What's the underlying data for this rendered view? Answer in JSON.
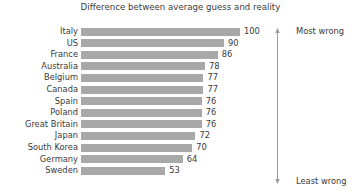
{
  "chart_data": {
    "type": "bar",
    "orientation": "horizontal",
    "title": "Difference between average guess and reality",
    "xlabel": "",
    "ylabel": "",
    "xlim": [
      0,
      100
    ],
    "grid": false,
    "legend": null,
    "categories": [
      "Italy",
      "US",
      "France",
      "Australia",
      "Belgium",
      "Canada",
      "Spain",
      "Poland",
      "Great Britain",
      "Japan",
      "South Korea",
      "Germany",
      "Sweden"
    ],
    "values": [
      100,
      90,
      86,
      78,
      77,
      77,
      76,
      76,
      76,
      72,
      70,
      64,
      53
    ],
    "bar_color": "#a8a8a8",
    "annotations": [
      {
        "text": "Most wrong",
        "position": "top-right"
      },
      {
        "text": "Least wrong",
        "position": "bottom-right"
      }
    ]
  },
  "rows": [
    {
      "label": "Italy",
      "value": 100
    },
    {
      "label": "US",
      "value": 90
    },
    {
      "label": "France",
      "value": 86
    },
    {
      "label": "Australia",
      "value": 78
    },
    {
      "label": "Belgium",
      "value": 77
    },
    {
      "label": "Canada",
      "value": 77
    },
    {
      "label": "Spain",
      "value": 76
    },
    {
      "label": "Poland",
      "value": 76
    },
    {
      "label": "Great Britain",
      "value": 76
    },
    {
      "label": "Japan",
      "value": 72
    },
    {
      "label": "South Korea",
      "value": 70
    },
    {
      "label": "Germany",
      "value": 64
    },
    {
      "label": "Sweden",
      "value": 53
    }
  ],
  "annotation": {
    "top_label": "Most wrong",
    "bottom_label": "Least wrong"
  },
  "colors": {
    "bar": "#a8a8a8",
    "text": "#3a3a3a",
    "arrow": "#8d8d8d",
    "background": "#ffffff"
  }
}
